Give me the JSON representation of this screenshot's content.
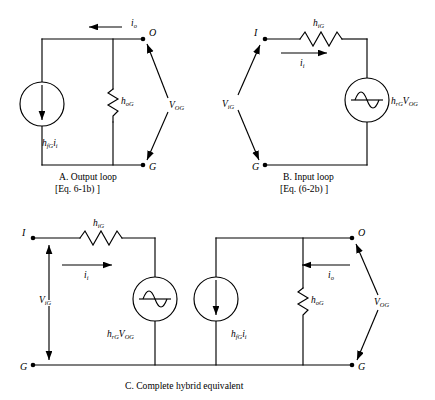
{
  "figure": {
    "background_color": "#ffffff",
    "line_color": "#000000"
  },
  "panels": [
    {
      "id": "A",
      "caption_line1": "A. Output loop",
      "caption_line2": "[Eq. 6-1b) ]",
      "nodes": [
        {
          "name": "node-o",
          "label": "O"
        },
        {
          "name": "node-g",
          "label": "G"
        }
      ],
      "components": [
        {
          "name": "current-source",
          "type": "current-source",
          "label_base": "h",
          "label_sub1": "fG",
          "label_base2": "i",
          "label_sub2": "i",
          "direction": "down"
        },
        {
          "name": "conductance-resistor",
          "type": "resistor",
          "label_base": "h",
          "label_sub": "oG"
        }
      ],
      "currents": [
        {
          "name": "output-current",
          "label_base": "i",
          "label_sub": "o",
          "direction": "left"
        }
      ],
      "voltages": [
        {
          "name": "output-voltage",
          "label_base": "V",
          "label_sub": "OG"
        }
      ]
    },
    {
      "id": "B",
      "caption_line1": "B. Input loop",
      "caption_line2": "[Eq. (6-2b) ]",
      "nodes": [
        {
          "name": "node-i",
          "label": "I"
        },
        {
          "name": "node-g",
          "label": "G"
        }
      ],
      "components": [
        {
          "name": "input-resistor",
          "type": "resistor",
          "label_base": "h",
          "label_sub": "iG"
        },
        {
          "name": "voltage-source",
          "type": "voltage-source",
          "label_base": "h",
          "label_sub1": "rG",
          "label_base2": "V",
          "label_sub2": "OG"
        }
      ],
      "currents": [
        {
          "name": "input-current",
          "label_base": "i",
          "label_sub": "i",
          "direction": "right"
        }
      ],
      "voltages": [
        {
          "name": "input-voltage",
          "label_base": "V",
          "label_sub": "iG"
        }
      ]
    },
    {
      "id": "C",
      "caption_line1": "C. Complete hybrid equivalent",
      "caption_line2": "",
      "nodes": [
        {
          "name": "node-i",
          "label": "I"
        },
        {
          "name": "node-o",
          "label": "O"
        },
        {
          "name": "node-g-left",
          "label": "G"
        },
        {
          "name": "node-g-right",
          "label": "G"
        }
      ],
      "components": [
        {
          "name": "input-resistor",
          "type": "resistor",
          "label_base": "h",
          "label_sub": "iG"
        },
        {
          "name": "voltage-source",
          "type": "voltage-source",
          "label_base": "h",
          "label_sub1": "rG",
          "label_base2": "V",
          "label_sub2": "OG"
        },
        {
          "name": "current-source",
          "type": "current-source",
          "label_base": "h",
          "label_sub1": "fG",
          "label_base2": "i",
          "label_sub2": "i",
          "direction": "down"
        },
        {
          "name": "conductance-resistor",
          "type": "resistor",
          "label_base": "h",
          "label_sub": "oG"
        }
      ],
      "currents": [
        {
          "name": "input-current",
          "label_base": "i",
          "label_sub": "i",
          "direction": "right"
        },
        {
          "name": "output-current",
          "label_base": "i",
          "label_sub": "o",
          "direction": "left"
        }
      ],
      "voltages": [
        {
          "name": "input-voltage",
          "label_base": "V",
          "label_sub": "iG"
        },
        {
          "name": "output-voltage",
          "label_base": "V",
          "label_sub": "OG"
        }
      ]
    }
  ]
}
